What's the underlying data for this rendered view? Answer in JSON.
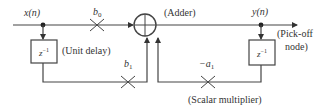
{
  "diagram": {
    "type": "signal-flow block diagram",
    "input_label": "x(n)",
    "output_label": "y(n)",
    "adder_label": "(Adder)",
    "unit_delay_label": "(Unit delay)",
    "delay_block_text": "z",
    "delay_block_exp": "−1",
    "pickoff_label_line1": "(Pick-off",
    "pickoff_label_line2": "node)",
    "scalar_multiplier_label": "(Scalar multiplier)",
    "coefficients": {
      "b0": {
        "base": "b",
        "sub": "0"
      },
      "b1": {
        "base": "b",
        "sub": "1"
      },
      "neg_a1": {
        "base": "−a",
        "sub": "1"
      }
    },
    "colors": {
      "line": "#444444",
      "text": "#333333",
      "background": "#ffffff"
    }
  }
}
